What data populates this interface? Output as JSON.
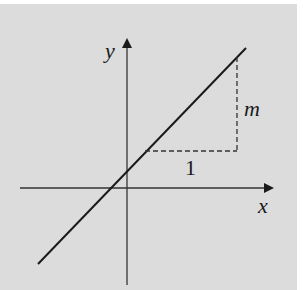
{
  "diagram": {
    "type": "slope-line-graph",
    "axes": {
      "x_label": "x",
      "y_label": "y"
    },
    "annotations": {
      "run_label": "1",
      "rise_label": "m"
    },
    "colors": {
      "background": "#dcdcdc",
      "ink": "#1a1a1a"
    }
  }
}
